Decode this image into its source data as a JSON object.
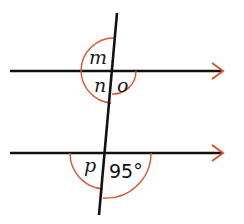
{
  "diagram": {
    "type": "parallel-lines-transversal",
    "colors": {
      "line": "#111111",
      "arc": "#d9532c",
      "arrow": "#d9532c"
    },
    "top_intersection": {
      "labels": {
        "m": "m",
        "n": "n",
        "o": "o"
      }
    },
    "bottom_intersection": {
      "labels": {
        "p": "p",
        "given_angle": "95°"
      }
    }
  }
}
